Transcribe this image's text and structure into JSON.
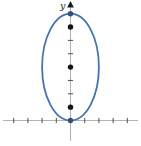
{
  "figure": {
    "y_axis_label": "y",
    "colors": {
      "ellipse_stroke": "#4573ad",
      "blue_point_fill": "#30507e",
      "black_point_fill": "#141414",
      "axis_line": "#b3b3b3",
      "tick": "#4f4f4f",
      "arrow": "#1c1c1c"
    }
  },
  "chart_data": {
    "type": "line",
    "title": "",
    "xlabel": "",
    "ylabel": "y",
    "xlim": [
      -4.8,
      4.9
    ],
    "ylim": [
      -1.9,
      8.9
    ],
    "grid": false,
    "x_ticks": [
      -4,
      -3,
      -2,
      -1,
      1,
      2,
      3,
      4
    ],
    "y_ticks": [
      1,
      2,
      3,
      4,
      5,
      6,
      7
    ],
    "series": [
      {
        "name": "ellipse",
        "shape": "ellipse",
        "center": [
          0,
          4
        ],
        "semi_axis_x": 2,
        "semi_axis_y": 4,
        "x_intercept": [
          0,
          0
        ],
        "top_vertex": [
          0,
          8
        ]
      }
    ],
    "marked_points": {
      "black": [
        [
          0,
          1
        ],
        [
          0,
          4
        ],
        [
          0,
          7
        ]
      ],
      "blue": [
        [
          0,
          0
        ],
        [
          0,
          8
        ]
      ]
    }
  }
}
